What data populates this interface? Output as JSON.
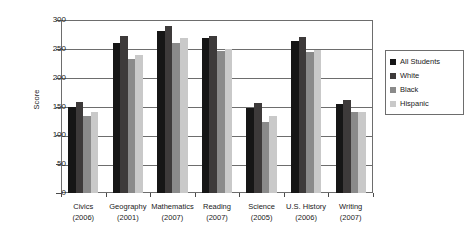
{
  "chart_data": {
    "type": "bar",
    "title": "",
    "xlabel": "",
    "ylabel": "Score",
    "ylim": [
      0,
      300
    ],
    "yticks": [
      0,
      50,
      100,
      150,
      200,
      250,
      300
    ],
    "grid": true,
    "legend_position": "right-outside",
    "categories": [
      "Civics",
      "Geography",
      "Mathematics",
      "Reading",
      "Science",
      "U.S. History",
      "Writing"
    ],
    "category_years": [
      "(2006)",
      "(2001)",
      "(2007)",
      "(2007)",
      "(2005)",
      "(2006)",
      "(2007)"
    ],
    "series": [
      {
        "name": "All Students",
        "color": "#161616",
        "values": [
          150,
          261,
          281,
          268,
          147,
          263,
          154
        ]
      },
      {
        "name": "White",
        "color": "#3d3a3a",
        "values": [
          158,
          272,
          289,
          272,
          156,
          271,
          161
        ]
      },
      {
        "name": "Black",
        "color": "#8a8a8a",
        "values": [
          133,
          232,
          261,
          246,
          124,
          244,
          141
        ]
      },
      {
        "name": "Hispanic",
        "color": "#c9c9c9",
        "values": [
          140,
          239,
          268,
          249,
          133,
          248,
          141
        ]
      }
    ]
  },
  "legend": {
    "items": [
      {
        "label": "All Students"
      },
      {
        "label": "White"
      },
      {
        "label": "Black"
      },
      {
        "label": "Hispanic"
      }
    ]
  }
}
